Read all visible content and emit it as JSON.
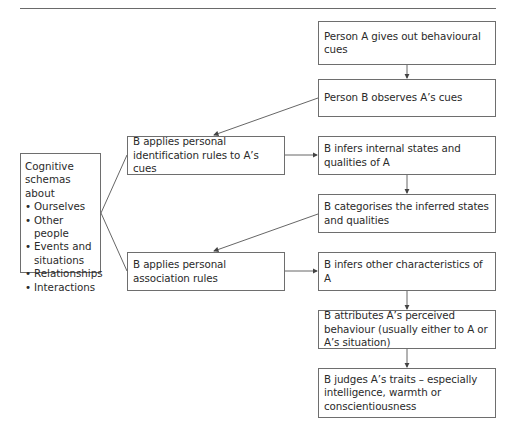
{
  "diagram": {
    "boxes": {
      "a_cues": "Person A gives out behavioural cues",
      "b_observes": "Person B observes A’s cues",
      "b_identification": "B applies personal identification rules to A’s cues",
      "b_infers_internal": "B infers internal states and qualities of A",
      "b_categorises": "B categorises the inferred states and qualities",
      "b_association": "B applies personal association rules",
      "b_infers_other": "B infers other characteristics of A",
      "b_attributes": "B attributes A’s perceived behaviour (usually either to A or A’s situation)",
      "b_judges": "B judges A’s traits – especially intelligence, warmth or conscientiousness"
    },
    "schemas": {
      "heading": "Cognitive schemas about",
      "items": [
        "Ourselves",
        "Other people",
        "Events and situations",
        "Relationships",
        "Interactions"
      ]
    },
    "colors": {
      "line": "#6e6e6e",
      "text": "#2a2a2a",
      "background": "#ffffff"
    }
  }
}
